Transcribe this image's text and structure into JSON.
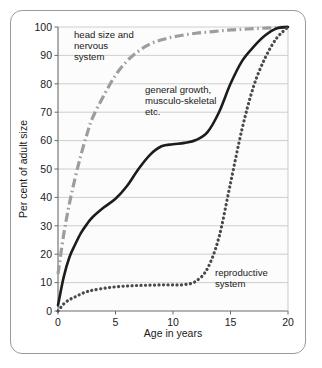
{
  "figure": {
    "name": "human-growth-curves-figure",
    "frame_color": "#9a9a9a",
    "background": "#ffffff"
  },
  "chart_data": {
    "type": "line",
    "title": "",
    "xlabel": "Age in years",
    "ylabel": "Per cent  of adult size",
    "xlim": [
      0,
      20
    ],
    "ylim": [
      0,
      100
    ],
    "xticks": [
      0,
      5,
      10,
      15,
      20
    ],
    "yticks": [
      0,
      10,
      20,
      30,
      40,
      50,
      60,
      70,
      80,
      90,
      100
    ],
    "grid": "horizontal",
    "legend": "annotations-inline",
    "plot_background": "#fcfcfc",
    "gridline_color": "#c8c8c8",
    "x": [
      0,
      0.5,
      1,
      1.5,
      2,
      2.5,
      3,
      4,
      5,
      6,
      7,
      8,
      9,
      10,
      11,
      12,
      13,
      14,
      15,
      16,
      17,
      18,
      19,
      20
    ],
    "series": [
      {
        "name": "head size and nervous system",
        "label": "head size and\nnervous\nsystem",
        "style": "dash-dot",
        "color": "#9d9d9d",
        "width": 3.2,
        "values": [
          13,
          27,
          38,
          47,
          55,
          62,
          68,
          76,
          83,
          88,
          91.5,
          94,
          95.5,
          96.5,
          97.2,
          97.8,
          98.2,
          98.6,
          99,
          99.2,
          99.4,
          99.6,
          99.8,
          100
        ]
      },
      {
        "name": "general growth, musculo-skeletal etc.",
        "label": "general growth,\nmusculo-skeletal\netc.",
        "style": "solid",
        "color": "#1c1c1c",
        "width": 2.6,
        "values": [
          2,
          12,
          19,
          23.5,
          27.5,
          30.5,
          33,
          36.5,
          39.5,
          44,
          50,
          55,
          58,
          58.7,
          59.2,
          60.2,
          63,
          70,
          80,
          88,
          93,
          97,
          99.5,
          100
        ]
      },
      {
        "name": "reproductive system",
        "label": "reproductive\nsystem",
        "style": "dotted",
        "color": "#4a4a4a",
        "width": 3.2,
        "values": [
          0,
          2.5,
          4,
          5,
          6,
          6.8,
          7.3,
          8,
          8.5,
          8.8,
          9,
          9.1,
          9.2,
          9.2,
          9.3,
          10.5,
          15,
          26,
          45,
          64,
          79,
          89,
          96,
          100
        ]
      }
    ],
    "annotations": [
      {
        "name": "head-nervous-annotation",
        "lines": [
          "head size and",
          "nervous",
          "system"
        ],
        "x_px": 74,
        "y_px": 38
      },
      {
        "name": "general-growth-annotation",
        "lines": [
          "general growth,",
          "musculo-skeletal",
          "etc."
        ],
        "x_px": 145,
        "y_px": 93
      },
      {
        "name": "reproductive-annotation",
        "lines": [
          "reproductive",
          "system"
        ],
        "x_px": 215,
        "y_px": 276
      }
    ]
  }
}
